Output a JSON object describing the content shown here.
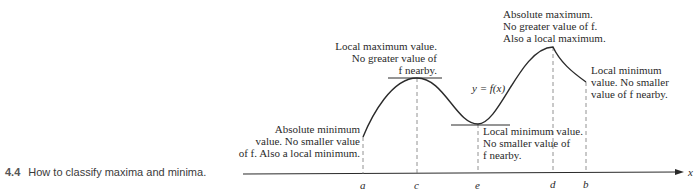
{
  "caption": {
    "number": "4.4",
    "text": "How to classify maxima and minima."
  },
  "axis": {
    "label": "x",
    "ticks": [
      {
        "name": "a",
        "x": 363
      },
      {
        "name": "c",
        "x": 417
      },
      {
        "name": "e",
        "x": 478
      },
      {
        "name": "d",
        "x": 553
      },
      {
        "name": "b",
        "x": 586
      }
    ]
  },
  "curve": {
    "label": "y = f(x)"
  },
  "annotations": {
    "abs_min": [
      "Absolute minimum",
      "value. No smaller value",
      "of f. Also a local minimum."
    ],
    "local_max": [
      "Local maximum value.",
      "No greater value of",
      "f nearby."
    ],
    "local_min_e": [
      "Local minimum value.",
      "No smaller value of",
      "f nearby."
    ],
    "abs_max": [
      "Absolute maximum.",
      "No greater value of f.",
      "Also a local maximum."
    ],
    "local_min_b": [
      "Local minimum",
      "value. No smaller",
      "value of f nearby."
    ]
  },
  "colors": {
    "ink": "#2a2a2a",
    "dashed": "#777777"
  }
}
